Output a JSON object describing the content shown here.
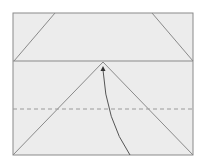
{
  "diagram": {
    "type": "fold-diagram",
    "colors": {
      "background": "#ffffff",
      "paper": "#ececec",
      "line": "#8a8a8a",
      "dashed": "#9a9a9a",
      "arrow": "#555555"
    },
    "frame": {
      "x": 13,
      "y": 13,
      "width": 180,
      "height": 142
    },
    "fold_line_y": 61,
    "dashed_line_y": 109,
    "apex": {
      "x": 103,
      "y": 62
    },
    "top_left_diagonal": {
      "x1": 55,
      "y1": 13,
      "x2": 14,
      "y2": 61
    },
    "top_right_diagonal": {
      "x1": 152,
      "y1": 13,
      "x2": 193,
      "y2": 61
    },
    "arrow_curve": {
      "start": {
        "x": 130,
        "y": 155
      },
      "control": {
        "x": 106,
        "y": 120
      },
      "end": {
        "x": 103,
        "y": 67
      }
    }
  }
}
